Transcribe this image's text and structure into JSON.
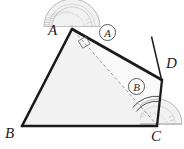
{
  "figure": {
    "kind": "geometry-diagram",
    "width": 184,
    "height": 149,
    "background_color": "#ffffff"
  },
  "labels": {
    "vertex_a": "A",
    "vertex_b": "B",
    "vertex_c": "C",
    "point_d": "D",
    "angle_marker_1": "A",
    "angle_marker_2": "B"
  },
  "points": {
    "A": {
      "x": 72,
      "y": 29
    },
    "B": {
      "x": 22,
      "y": 126
    },
    "C": {
      "x": 157,
      "y": 126
    },
    "D": {
      "x": 162,
      "y": 80
    }
  },
  "segments": [
    {
      "name": "side-ab",
      "from": "A",
      "to": "B",
      "style": "solid-thick"
    },
    {
      "name": "side-bc",
      "from": "B",
      "to": "C",
      "style": "solid-thick"
    },
    {
      "name": "ray-ad",
      "from": "A",
      "to": "D",
      "style": "solid-thick"
    },
    {
      "name": "segment-dc",
      "from": "D",
      "to": "C",
      "style": "solid-thick"
    },
    {
      "name": "diagonal-ac",
      "from": "A",
      "to": "C",
      "style": "dashed-thin"
    },
    {
      "name": "tick-line-through-d",
      "from": "(152,37)",
      "to": "(161,79)",
      "style": "solid-thin"
    }
  ],
  "markers": {
    "right_angle_at_a": "right-angle-square",
    "angle_arc_at_c": "single-arc",
    "protractor_at_a": "half-disc-protractor",
    "protractor_at_c": "half-disc-protractor"
  },
  "colors": {
    "stroke": "#1a1a1a",
    "triangle_fill": "#f2f2f2",
    "dashed_stroke": "#7d7d7d",
    "protractor_stroke": "#b4b4b4",
    "protractor_fill": "#f0f0f0",
    "label_text": "#1c1c1c",
    "circle_outline": "#585858"
  }
}
